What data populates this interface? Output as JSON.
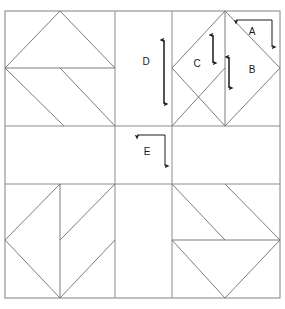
{
  "diagram": {
    "type": "quilt-block-schematic",
    "colors": {
      "background": "#ffffff",
      "frame_stroke": "#8c8c8c",
      "grid_stroke": "#8c8c8c",
      "patch_stroke": "#6e6e6e",
      "dimension_stroke": "#1a1a1a",
      "label_text": "#1a1a1a"
    },
    "frame": {
      "left": 5,
      "top": 11,
      "right": 280,
      "bottom": 298
    },
    "grid": {
      "vertical_lines": [
        115,
        172
      ],
      "horizontal_lines": [
        126,
        184
      ]
    }
  },
  "dimension_markers": [
    {
      "id": "A",
      "label": "A",
      "kind": "corner-bracket",
      "orientation": "horizontal-left-then-down",
      "label_x": 252,
      "label_y": 32,
      "arrowheads": [
        "left",
        "down"
      ]
    },
    {
      "id": "B",
      "label": "B",
      "kind": "double-arrow",
      "orientation": "vertical",
      "label_x": 252,
      "label_y": 70,
      "arrowheads": [
        "up",
        "down"
      ]
    },
    {
      "id": "C",
      "label": "C",
      "kind": "double-arrow",
      "orientation": "vertical",
      "label_x": 197,
      "label_y": 64,
      "arrowheads": [
        "up",
        "down"
      ]
    },
    {
      "id": "D",
      "label": "D",
      "kind": "double-arrow",
      "orientation": "vertical",
      "label_x": 146,
      "label_y": 62,
      "arrowheads": [
        "up",
        "down"
      ]
    },
    {
      "id": "E",
      "label": "E",
      "kind": "corner-bracket",
      "orientation": "horizontal-left-then-down",
      "label_x": 147,
      "label_y": 152,
      "arrowheads": [
        "left",
        "down"
      ]
    }
  ],
  "quadrants": [
    {
      "id": "top-left",
      "name": "top-left-block",
      "motif": "half-square-and-parallelogram"
    },
    {
      "id": "top-right",
      "name": "top-right-block",
      "motif": "half-square-and-parallelogram"
    },
    {
      "id": "bottom-left",
      "name": "bottom-left-block",
      "motif": "half-square-and-parallelogram"
    },
    {
      "id": "bottom-right",
      "name": "bottom-right-block",
      "motif": "half-square-and-parallelogram"
    }
  ]
}
